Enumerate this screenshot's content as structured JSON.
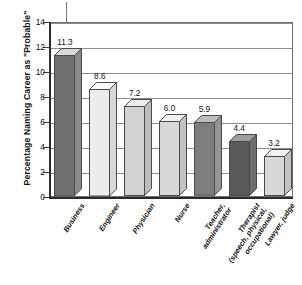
{
  "chart_data": {
    "type": "bar",
    "title": "",
    "subtitle": "",
    "xlabel": "",
    "ylabel": "Percentage Naming Career as \"Probable\"",
    "ylim": [
      0,
      14
    ],
    "ytick_step": 2,
    "yticks": [
      "0",
      "2",
      "4",
      "6",
      "8",
      "10",
      "12",
      "14"
    ],
    "grid": true,
    "legend": "none",
    "three_d": true,
    "categories": [
      "Business",
      "Engineer",
      "Physician",
      "Nurse",
      "Teacher,\nadministrator",
      "Therapist\n(speech, physical,\noccupational)",
      "Lawyer, judge"
    ],
    "values": [
      11.3,
      8.6,
      7.2,
      6.0,
      5.9,
      4.4,
      3.2
    ],
    "value_labels": [
      "11.3",
      "8.6",
      "7.2",
      "6.0",
      "5.9",
      "4.4",
      "3.2"
    ],
    "bar_colors": [
      "#6f6f6f",
      "#ededed",
      "#d2d2d2",
      "#d8d8d8",
      "#7d7d7d",
      "#5a5a5a",
      "#d8d8d8"
    ],
    "bar_top_colors": [
      "#d8d8d8",
      "#fafafa",
      "#efefef",
      "#f2f2f2",
      "#bdbdbd",
      "#9d9d9d",
      "#f2f2f2"
    ],
    "bar_side_colors": [
      "#8a8a8a",
      "#d8d8d8",
      "#bcbcbc",
      "#c2c2c2",
      "#949494",
      "#6d6d6d",
      "#c2c2c2"
    ],
    "annotation": {
      "type": "vertical-line-with-dot",
      "label": ""
    }
  }
}
